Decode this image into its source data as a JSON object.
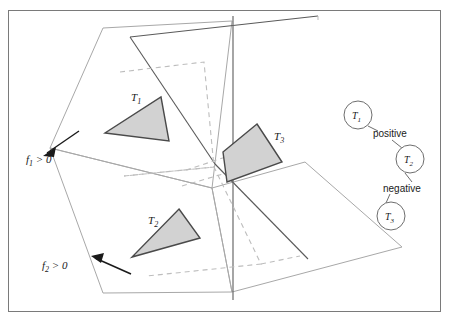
{
  "figure": {
    "name": "bsp-tree-partition-figure",
    "background": "#ffffff",
    "border_color": "#7a7a7a",
    "colors": {
      "triangle_fill": "#d2d2d2",
      "triangle_stroke": "#4a4a4a",
      "plane_stroke": "#9a9a9a",
      "plane_stroke_dark": "#555555",
      "dashed_stroke": "#b4b4b4",
      "arrow_stroke": "#1a1a1a",
      "node_stroke": "#6e6e6e",
      "text_color": "#1a1a1a"
    }
  },
  "scene": {
    "title": "",
    "polygon_labels": [
      {
        "id": "T1",
        "text": "T",
        "sub": "1",
        "x": 131,
        "y": 101
      },
      {
        "id": "T2",
        "text": "T",
        "sub": "2",
        "x": 148,
        "y": 224
      },
      {
        "id": "T3",
        "text": "T",
        "sub": "3",
        "x": 274,
        "y": 140
      }
    ],
    "halfspace_labels": [
      {
        "id": "f1",
        "text": "f",
        "sub": "1",
        "rel": " > 0",
        "x": 26,
        "y": 162
      },
      {
        "id": "f2",
        "text": "f",
        "sub": "2",
        "rel": " > 0",
        "x": 42,
        "y": 268
      }
    ]
  },
  "tree": {
    "nodes": [
      {
        "id": "T1",
        "text": "T",
        "sub": "1",
        "cx": 358,
        "cy": 115,
        "r": 14
      },
      {
        "id": "T2",
        "text": "T",
        "sub": "2",
        "cx": 410,
        "cy": 159,
        "r": 14
      },
      {
        "id": "T3",
        "text": "T",
        "sub": "3",
        "cx": 391,
        "cy": 216,
        "r": 14
      }
    ],
    "edges": [
      {
        "id": "edge-positive",
        "label": "positive",
        "from": "T1",
        "to": "T2",
        "label_x": 392,
        "label_y": 133
      },
      {
        "id": "edge-negative",
        "label": "negative",
        "from": "T2",
        "to": "T3",
        "label_x": 407,
        "label_y": 188
      }
    ]
  }
}
